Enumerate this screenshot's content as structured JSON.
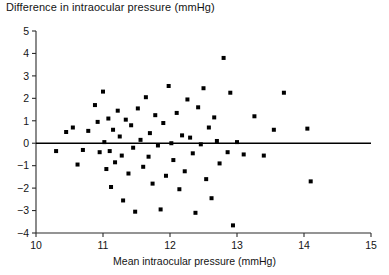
{
  "chart_data": {
    "type": "scatter",
    "title": "Difference in intraocular pressure (mmHg)",
    "xlabel": "Mean intraocular pressure (mmHg)",
    "ylabel": "",
    "xlim": [
      10,
      15
    ],
    "ylim": [
      -4,
      5
    ],
    "xticks": [
      10,
      11,
      12,
      13,
      14,
      15
    ],
    "xtick_labels": [
      "10",
      "11",
      "12",
      "13",
      "14",
      "15"
    ],
    "yticks": [
      -4,
      -3,
      -2,
      -1,
      0,
      1,
      2,
      3,
      4,
      5
    ],
    "ytick_labels": [
      "−4",
      "−3",
      "−2",
      "−1",
      "0",
      "1",
      "2",
      "3",
      "4",
      "5"
    ],
    "grid": false,
    "legend": null,
    "marker": "square",
    "marker_color": "#000000",
    "reference_line": {
      "type": "horizontal",
      "y": 0,
      "color": "#000000",
      "x_start": 10.0,
      "x_end": 15.0
    },
    "points": [
      [
        10.3,
        -0.35
      ],
      [
        10.45,
        0.5
      ],
      [
        10.55,
        0.7
      ],
      [
        10.62,
        -0.95
      ],
      [
        10.7,
        -0.3
      ],
      [
        10.78,
        0.55
      ],
      [
        10.88,
        1.7
      ],
      [
        10.92,
        0.95
      ],
      [
        10.95,
        -0.4
      ],
      [
        11.0,
        2.3
      ],
      [
        11.02,
        0.05
      ],
      [
        11.05,
        -1.15
      ],
      [
        11.08,
        1.1
      ],
      [
        11.1,
        -0.35
      ],
      [
        11.12,
        -1.95
      ],
      [
        11.15,
        0.6
      ],
      [
        11.18,
        -0.85
      ],
      [
        11.22,
        1.45
      ],
      [
        11.25,
        0.3
      ],
      [
        11.28,
        -0.55
      ],
      [
        11.3,
        -2.55
      ],
      [
        11.34,
        1.05
      ],
      [
        11.38,
        -1.35
      ],
      [
        11.42,
        0.8
      ],
      [
        11.45,
        -0.2
      ],
      [
        11.48,
        -3.05
      ],
      [
        11.52,
        1.55
      ],
      [
        11.56,
        0.15
      ],
      [
        11.6,
        -1.05
      ],
      [
        11.64,
        2.05
      ],
      [
        11.68,
        -0.6
      ],
      [
        11.7,
        0.45
      ],
      [
        11.74,
        -1.8
      ],
      [
        11.78,
        1.25
      ],
      [
        11.82,
        -0.1
      ],
      [
        11.86,
        -2.95
      ],
      [
        11.9,
        0.9
      ],
      [
        11.94,
        -1.45
      ],
      [
        11.98,
        2.55
      ],
      [
        12.02,
        0.0
      ],
      [
        12.05,
        -0.75
      ],
      [
        12.1,
        1.35
      ],
      [
        12.14,
        -2.05
      ],
      [
        12.18,
        0.35
      ],
      [
        12.22,
        -1.25
      ],
      [
        12.26,
        1.95
      ],
      [
        12.3,
        0.25
      ],
      [
        12.34,
        -0.45
      ],
      [
        12.38,
        -3.1
      ],
      [
        12.42,
        1.6
      ],
      [
        12.46,
        -0.05
      ],
      [
        12.5,
        2.45
      ],
      [
        12.54,
        -1.6
      ],
      [
        12.58,
        0.7
      ],
      [
        12.62,
        -2.45
      ],
      [
        12.66,
        1.15
      ],
      [
        12.7,
        0.1
      ],
      [
        12.74,
        -0.9
      ],
      [
        12.8,
        3.8
      ],
      [
        12.86,
        -0.4
      ],
      [
        12.9,
        2.25
      ],
      [
        12.94,
        -3.66
      ],
      [
        13.0,
        0.05
      ],
      [
        13.1,
        -0.5
      ],
      [
        13.26,
        1.2
      ],
      [
        13.4,
        -0.55
      ],
      [
        13.55,
        0.6
      ],
      [
        13.7,
        2.25
      ],
      [
        14.05,
        0.65
      ],
      [
        14.1,
        -1.7
      ]
    ]
  }
}
